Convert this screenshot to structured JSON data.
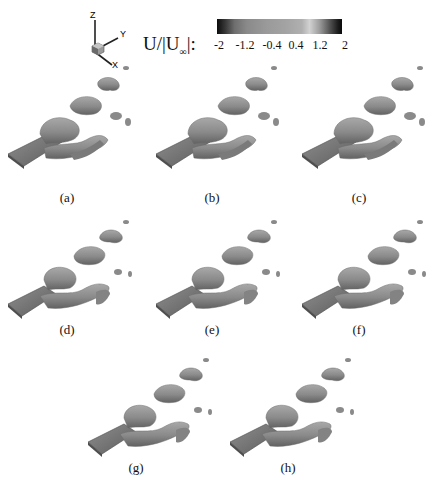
{
  "figure": {
    "colorbar": {
      "label_main": "U/|U",
      "label_sub": "∞",
      "label_end": "|:",
      "ticks": [
        "-2",
        "-1.2",
        "-0.4",
        "0.4",
        "1.2",
        "2"
      ],
      "range": [
        -2,
        2
      ],
      "colormap": "grayscale (dark at extremes, light near 1.2)"
    },
    "axes_triad": {
      "x": "X",
      "y": "Y",
      "z": "Z"
    },
    "panels": [
      {
        "id": "a",
        "caption": "(a)"
      },
      {
        "id": "b",
        "caption": "(b)"
      },
      {
        "id": "c",
        "caption": "(c)"
      },
      {
        "id": "d",
        "caption": "(d)"
      },
      {
        "id": "e",
        "caption": "(e)"
      },
      {
        "id": "f",
        "caption": "(f)"
      },
      {
        "id": "g",
        "caption": "(g)"
      },
      {
        "id": "h",
        "caption": "(h)"
      }
    ],
    "colors": {
      "isosurface": "#8c8c8c",
      "isosurface_dark": "#5f5f5f",
      "isosurface_light": "#b4b4b4",
      "plate": "#7a7a7a"
    }
  }
}
